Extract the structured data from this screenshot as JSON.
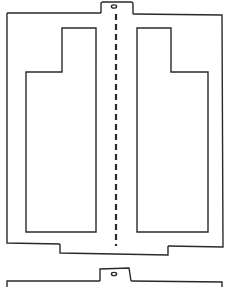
{
  "diagram": {
    "title": "",
    "colors": {
      "stroke": "#2a2a2a",
      "background": "#ffffff"
    },
    "parts": {
      "top_tab": {
        "label": "",
        "hole": "oval"
      },
      "panel": {
        "label": ""
      },
      "left_cutout": {
        "label": "",
        "shape": "stepped-rectangle"
      },
      "right_cutout": {
        "label": "",
        "shape": "stepped-rectangle"
      },
      "fold_line": {
        "label": "",
        "style": "dashed"
      },
      "bottom_tab": {
        "label": ""
      },
      "second_panel": {
        "label": "",
        "visible": "top edge only",
        "hole": "oval"
      }
    }
  }
}
